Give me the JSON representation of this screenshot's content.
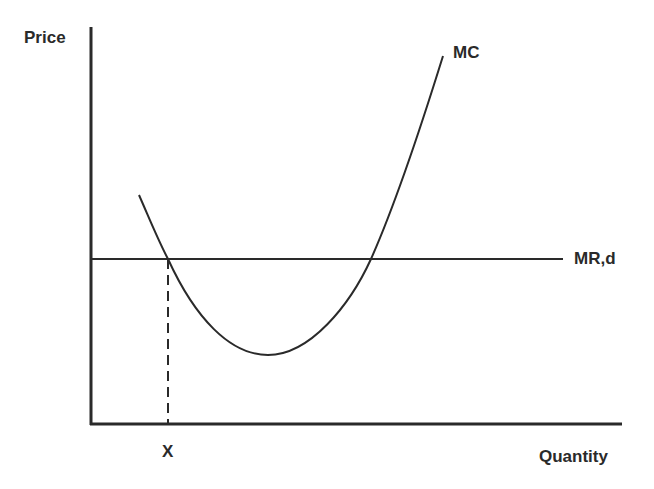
{
  "diagram": {
    "type": "economics-cost-curve",
    "y_axis_label": "Price",
    "x_axis_label": "Quantity",
    "curves": [
      {
        "id": "mc",
        "label": "MC",
        "shape": "U-shaped parabola"
      },
      {
        "id": "mr",
        "label": "MR,d",
        "shape": "horizontal line"
      }
    ],
    "marker": {
      "label": "X",
      "style": "dashed vertical line from MC/MR intersection to quantity axis"
    },
    "colors": {
      "line": "#2a2a2a",
      "background": "#ffffff"
    }
  }
}
